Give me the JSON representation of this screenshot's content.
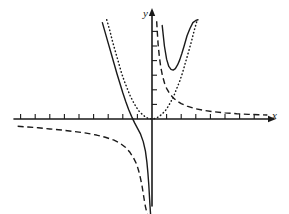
{
  "figure": {
    "kind": "cartesian-graph",
    "width": 289,
    "height": 214,
    "background_color": "#ffffff",
    "stroke_color": "#1a1a1a"
  },
  "axes": {
    "x_label": "x",
    "y_label": "y",
    "origin_px": {
      "x": 152,
      "y": 119
    },
    "unit_px": 14.6,
    "x_axis": {
      "start_px": 14,
      "end_px": 268,
      "arrow": true,
      "tick_length_px": 5,
      "tick_positions_units": [
        -9,
        -8,
        -7,
        -6,
        -5,
        -4,
        -3,
        -2,
        -1,
        1,
        2,
        3,
        4,
        5,
        6,
        7
      ]
    },
    "y_axis": {
      "start_px": 206,
      "end_px": 16,
      "arrow": true,
      "tick_length_px": 5,
      "tick_positions_units": [
        1,
        2,
        3,
        4,
        5,
        6
      ]
    }
  },
  "chart_data": {
    "type": "line",
    "title": "",
    "xlabel": "x",
    "ylabel": "y",
    "grid": false,
    "legend": null,
    "xlim": [
      -9.5,
      8
    ],
    "ylim": [
      -6.5,
      6.8
    ],
    "series": [
      {
        "name": "solid-curve",
        "style": "solid",
        "description": "curve with vertical asymptote at x = 0; left branch falls from upper left through x-axis down to minus infinity, right branch is a U shape with minimum above the axis",
        "color": "#1a1a1a",
        "linewidth": 1.4,
        "x": [
          -3.4,
          -3.2,
          -3.0,
          -2.8,
          -2.6,
          -2.4,
          -2.2,
          -2.0,
          -1.8,
          -1.6,
          -1.4,
          -1.2,
          -1.0,
          -0.8,
          -0.6,
          -0.45,
          -0.35,
          -0.28,
          -0.22,
          -0.18,
          -0.14,
          -0.1
        ],
        "y": [
          6.6,
          5.9,
          5.2,
          4.5,
          3.8,
          3.1,
          2.45,
          1.8,
          1.2,
          0.65,
          0.18,
          -0.25,
          -0.62,
          -1.0,
          -1.55,
          -2.2,
          -2.95,
          -3.7,
          -4.5,
          -5.2,
          -5.9,
          -6.5
        ],
        "x2": [
          0.7,
          0.85,
          1.0,
          1.15,
          1.3,
          1.45,
          1.6,
          1.75,
          1.9,
          2.05,
          2.2,
          2.4,
          2.6,
          2.8,
          3.0,
          3.15
        ],
        "y2": [
          6.4,
          5.0,
          4.1,
          3.6,
          3.4,
          3.35,
          3.45,
          3.7,
          4.05,
          4.5,
          5.0,
          5.7,
          6.2,
          6.6,
          6.75,
          6.8
        ]
      },
      {
        "name": "dotted-parabola",
        "style": "dotted",
        "description": "upward parabola with vertex at the origin, passing through the intersection point with the dashed hyperbola",
        "color": "#1a1a1a",
        "linewidth": 1.4,
        "x": [
          -3.1,
          -2.9,
          -2.7,
          -2.5,
          -2.3,
          -2.1,
          -1.9,
          -1.7,
          -1.5,
          -1.3,
          -1.1,
          -0.9,
          -0.7,
          -0.5,
          -0.3,
          -0.1,
          0.1,
          0.3,
          0.5,
          0.7,
          0.9,
          1.1,
          1.3,
          1.5,
          1.7,
          1.9,
          2.1,
          2.3,
          2.5,
          2.7,
          2.9,
          3.1
        ],
        "y": [
          6.8,
          6.1,
          5.3,
          4.6,
          3.9,
          3.2,
          2.6,
          2.1,
          1.6,
          1.2,
          0.85,
          0.55,
          0.35,
          0.18,
          0.06,
          0.01,
          0.01,
          0.06,
          0.18,
          0.35,
          0.55,
          0.85,
          1.2,
          1.6,
          2.1,
          2.6,
          3.2,
          3.9,
          4.6,
          5.3,
          6.1,
          6.8
        ]
      },
      {
        "name": "dashed-hyperbola",
        "style": "dashed",
        "description": "reciprocal curve y = 1/x; left branch below the x-axis approaching it from the far left and dropping along the y-axis, right branch descending from high near the y-axis toward the x-axis",
        "color": "#1a1a1a",
        "linewidth": 1.4,
        "x": [
          -9.2,
          -8.5,
          -7.8,
          -7.0,
          -6.2,
          -5.4,
          -4.6,
          -3.8,
          -3.2,
          -2.6,
          -2.2,
          -1.8,
          -1.5,
          -1.25,
          -1.05,
          -0.9,
          -0.78,
          -0.68,
          -0.6,
          -0.52,
          -0.45,
          -0.38,
          -0.32,
          -0.27,
          -0.22
        ],
        "y": [
          -0.5,
          -0.55,
          -0.6,
          -0.68,
          -0.75,
          -0.85,
          -0.95,
          -1.1,
          -1.25,
          -1.45,
          -1.65,
          -1.95,
          -2.3,
          -2.7,
          -3.1,
          -3.6,
          -4.1,
          -4.6,
          -5.1,
          -5.6,
          -6.0,
          -6.3,
          -6.5,
          -6.6,
          -6.7
        ],
        "x2": [
          0.32,
          0.36,
          0.42,
          0.5,
          0.6,
          0.72,
          0.86,
          1.0,
          1.2,
          1.45,
          1.7,
          2.0,
          2.4,
          2.9,
          3.5,
          4.2,
          5.0,
          5.8,
          6.6,
          7.3,
          7.9
        ],
        "y2": [
          6.7,
          6.0,
          5.1,
          4.3,
          3.55,
          2.95,
          2.45,
          2.1,
          1.75,
          1.45,
          1.25,
          1.05,
          0.88,
          0.72,
          0.6,
          0.5,
          0.42,
          0.36,
          0.32,
          0.29,
          0.27
        ]
      }
    ],
    "annotations": [
      {
        "name": "intersection-point",
        "description": "crossing of the dotted parabola and the dashed hyperbola",
        "x": 1.55,
        "y": 1.9
      }
    ]
  }
}
